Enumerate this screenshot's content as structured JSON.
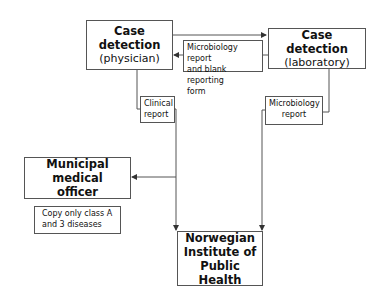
{
  "diagram": {
    "nodes": {
      "physician": {
        "title": "Case detection",
        "subtitle": "(physician)"
      },
      "laboratory": {
        "title": "Case detection",
        "subtitle": "(laboratory)"
      },
      "municipal": {
        "title_line1": "Municipal medical",
        "title_line2": "officer"
      },
      "institute": {
        "line1": "Norwegian",
        "line2": "Institute of",
        "line3": "Public Health"
      }
    },
    "edge_labels": {
      "lab_to_physician": {
        "line1": "Microbiology report",
        "line2": "and blank reporting",
        "line3": "form"
      },
      "physician_to_institute": {
        "line1": "Clinical",
        "line2": "report"
      },
      "lab_to_institute": {
        "line1": "Microbiology",
        "line2": "report"
      },
      "municipal_note": {
        "line1": "Copy only class A",
        "line2": "and 3 diseases"
      }
    },
    "edges": [
      {
        "from": "physician",
        "to": "laboratory"
      },
      {
        "from": "laboratory",
        "to": "physician",
        "label": "Microbiology report and blank reporting form"
      },
      {
        "from": "physician",
        "to": "institute",
        "label": "Clinical report"
      },
      {
        "from": "laboratory",
        "to": "institute",
        "label": "Microbiology report"
      },
      {
        "from": "physician",
        "to": "municipal",
        "label": "Copy only class A and 3 diseases"
      }
    ],
    "colors": {
      "line": "#555555",
      "text": "#111111",
      "background": "#ffffff"
    }
  }
}
